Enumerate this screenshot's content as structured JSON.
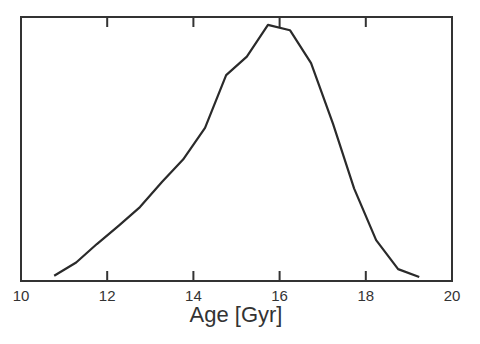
{
  "chart_data": {
    "type": "line",
    "title": "",
    "xlabel": "Age [Gyr]",
    "ylabel": "",
    "xlim": [
      10,
      20
    ],
    "ylim": [
      0,
      1
    ],
    "x_ticks": [
      "10",
      "12",
      "14",
      "16",
      "18",
      "20"
    ],
    "y_ticks": [],
    "grid": false,
    "legend": null,
    "series": [
      {
        "name": "age distribution",
        "x": [
          10.77,
          11.28,
          11.76,
          12.27,
          12.76,
          13.27,
          13.76,
          14.27,
          14.76,
          15.24,
          15.73,
          16.24,
          16.73,
          17.24,
          17.73,
          18.24,
          18.75,
          19.24
        ],
        "y": [
          0.02,
          0.07,
          0.14,
          0.21,
          0.28,
          0.375,
          0.46,
          0.58,
          0.78,
          0.85,
          0.97,
          0.95,
          0.825,
          0.595,
          0.35,
          0.155,
          0.045,
          0.015
        ]
      }
    ]
  }
}
